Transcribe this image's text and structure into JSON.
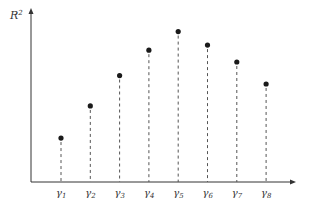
{
  "chart_data": {
    "type": "scatter",
    "style": "lollipop-dashed-stems",
    "title": "",
    "xlabel": "",
    "ylabel": "R^2",
    "ylabel_base": "R",
    "ylabel_sup": "2",
    "categories": [
      "γ1",
      "γ2",
      "γ3",
      "γ4",
      "γ5",
      "γ6",
      "γ7",
      "γ8"
    ],
    "labels": [
      {
        "base": "γ",
        "sub": "1"
      },
      {
        "base": "γ",
        "sub": "2"
      },
      {
        "base": "γ",
        "sub": "3"
      },
      {
        "base": "γ",
        "sub": "4"
      },
      {
        "base": "γ",
        "sub": "5"
      },
      {
        "base": "γ",
        "sub": "6"
      },
      {
        "base": "γ",
        "sub": "7"
      },
      {
        "base": "γ",
        "sub": "8"
      }
    ],
    "values": [
      0.26,
      0.45,
      0.63,
      0.78,
      0.89,
      0.81,
      0.71,
      0.58
    ],
    "ylim": [
      0,
      1
    ],
    "grid": false,
    "legend": null,
    "colors": {
      "points": "#1a1a1a",
      "axes": "#333333",
      "stems": "#555555"
    }
  }
}
